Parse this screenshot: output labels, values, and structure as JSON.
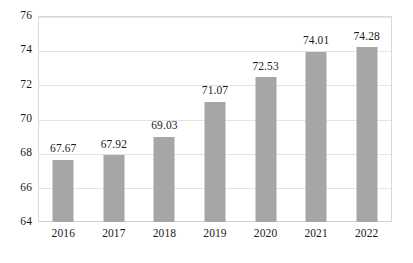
{
  "chart_data": {
    "type": "bar",
    "title": "",
    "subtitle": "",
    "xlabel": "",
    "ylabel": "",
    "categories": [
      "2016",
      "2017",
      "2018",
      "2019",
      "2020",
      "2021",
      "2022"
    ],
    "values": [
      67.67,
      67.92,
      69.03,
      71.07,
      72.53,
      74.01,
      74.28
    ],
    "data_labels": [
      "67.67",
      "67.92",
      "69.03",
      "71.07",
      "72.53",
      "74.01",
      "74.28"
    ],
    "ylim": [
      64,
      76
    ],
    "ytick_labels": [
      "76",
      "74",
      "72",
      "70",
      "68",
      "66",
      "64"
    ],
    "ytick_values": [
      76,
      74,
      72,
      70,
      68,
      66,
      64
    ],
    "grid": true,
    "legend": null,
    "legend_position": "none",
    "colors": {
      "bar": "#a6a6a6",
      "gridline": "#e3e3e3",
      "plot_border": "#d9d9d9",
      "background": "#ffffff",
      "text": "#1a1a1a"
    }
  }
}
